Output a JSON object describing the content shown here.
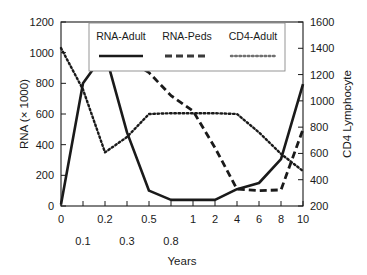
{
  "chart_data": {
    "type": "line",
    "title": "",
    "xlabel": "Years",
    "ylabel": "RNA (× 1000)",
    "y2label": "CD4 Lymphocyte",
    "x": [
      "0",
      "0.1",
      "0.2",
      "0.3",
      "0.5",
      "0.8",
      "1",
      "2",
      "4",
      "6",
      "8",
      "10"
    ],
    "x_tick_labels_row1": [
      "0",
      "",
      "0.2",
      "",
      "0.5",
      "",
      "1",
      "2",
      "4",
      "6",
      "8",
      "10"
    ],
    "x_tick_labels_row2": [
      "",
      "0.1",
      "",
      "0.3",
      "",
      "0.8",
      "",
      "",
      "",
      "",
      "",
      ""
    ],
    "ylim": [
      0,
      1200
    ],
    "yticks": [
      0,
      200,
      400,
      600,
      800,
      1000,
      1200
    ],
    "y2lim": [
      200,
      1600
    ],
    "y2ticks": [
      200,
      400,
      600,
      800,
      1000,
      1200,
      1400,
      1600
    ],
    "grid": false,
    "legend_position": "top-center",
    "axis_note": "x-axis is categorical with evenly spaced ticks",
    "series": [
      {
        "name": "RNA-Adult",
        "style": "solid",
        "axis": "left",
        "color": "#1a1a1a",
        "values": [
          10,
          800,
          1000,
          480,
          100,
          40,
          40,
          40,
          110,
          150,
          305,
          795
        ]
      },
      {
        "name": "RNA-Peds",
        "style": "dashed",
        "axis": "left",
        "color": "#3a3a3a",
        "values": [
          null,
          null,
          1000,
          960,
          870,
          720,
          620,
          380,
          110,
          100,
          105,
          500
        ]
      },
      {
        "name": "CD4-Adult",
        "style": "dotted",
        "axis": "left",
        "color": "#707070",
        "values": [
          1030,
          760,
          350,
          450,
          600,
          605,
          605,
          605,
          600,
          480,
          340,
          228
        ]
      }
    ],
    "series_right_axis_values": [
      {
        "name": "CD4-Adult",
        "note": "read on right CD4 Lymphocyte axis",
        "values": [
          1400,
          1080,
          610,
          725,
          900,
          905,
          905,
          905,
          900,
          760,
          600,
          465
        ]
      }
    ]
  },
  "legend": {
    "entries": [
      {
        "label": "RNA-Adult",
        "style": "solid"
      },
      {
        "label": "RNA-Peds",
        "style": "dashed"
      },
      {
        "label": "CD4-Adult",
        "style": "dotted"
      }
    ]
  }
}
